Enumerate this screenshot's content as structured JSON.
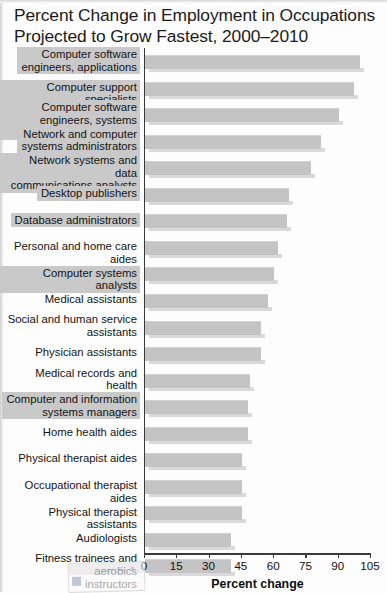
{
  "title": "Percent Change in Employment in Occupations Projected to Grow Fastest, 2000–2010",
  "window_artifact": {
    "minimize_label": "–",
    "maximize_label": "□",
    "close_label": "×",
    "icon_name": "app-icon"
  },
  "chart_data": {
    "type": "bar",
    "orientation": "horizontal",
    "title": "Percent Change in Employment in Occupations Projected to Grow Fastest, 2000–2010",
    "xlabel": "Percent change",
    "ylabel": "",
    "xlim": [
      0,
      105
    ],
    "xticks": [
      0,
      15,
      30,
      45,
      60,
      75,
      90,
      105
    ],
    "xticklabels": [
      "0",
      "15",
      "30",
      "45",
      "60",
      "75",
      "90",
      "105"
    ],
    "grid": false,
    "legend": null,
    "bar_color": "#c4c4c4",
    "highlight_color": "#c9c9c9",
    "categories": [
      "Computer software engineers, applications",
      "Computer support specialists",
      "Computer software engineers, systems software",
      "Network and computer systems administrators",
      "Network systems and data communications analysts",
      "Desktop publishers",
      "Database administrators",
      "Personal and home care aides",
      "Computer systems analysts",
      "Medical assistants",
      "Social and human service assistants",
      "Physician assistants",
      "Medical records and health information technicians",
      "Computer and information systems managers",
      "Home health aides",
      "Physical therapist aides",
      "Occupational therapist aides",
      "Physical therapist assistants",
      "Audiologists",
      "Fitness trainees and aerobics instructors"
    ],
    "values": [
      100,
      97,
      90,
      82,
      77,
      67,
      66,
      62,
      60,
      57,
      54,
      54,
      49,
      48,
      48,
      45,
      45,
      45,
      40,
      40
    ],
    "highlighted": [
      true,
      true,
      true,
      true,
      true,
      true,
      true,
      false,
      true,
      false,
      false,
      false,
      false,
      true,
      false,
      false,
      false,
      false,
      false,
      false
    ],
    "label_lines": [
      [
        "Computer software",
        "engineers, applications"
      ],
      [
        "Computer support specialists"
      ],
      [
        "Computer software",
        "engineers, systems software"
      ],
      [
        "Network and computer",
        "systems administrators"
      ],
      [
        "Network systems and data",
        "communications analysts"
      ],
      [
        "Desktop publishers"
      ],
      [
        "Database administrators"
      ],
      [
        "Personal and home care aides"
      ],
      [
        "Computer systems analysts"
      ],
      [
        "Medical assistants"
      ],
      [
        "Social and human service",
        "assistants"
      ],
      [
        "Physician assistants"
      ],
      [
        "Medical records and health",
        "information technicians"
      ],
      [
        "Computer and information",
        "systems managers"
      ],
      [
        "Home health aides"
      ],
      [
        "Physical therapist aides"
      ],
      [
        "Occupational therapist aides"
      ],
      [
        "Physical therapist assistants"
      ],
      [
        "Audiologists"
      ],
      [
        "Fitness trainees and aerobics",
        "instructors"
      ]
    ]
  }
}
